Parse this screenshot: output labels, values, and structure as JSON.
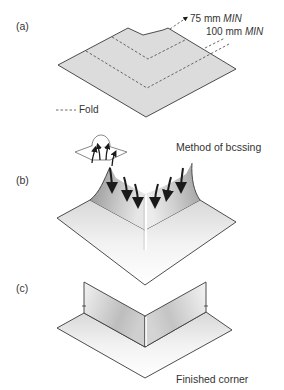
{
  "figure": {
    "panels": [
      {
        "id": "a",
        "label": "(a)",
        "annotations": {
          "dim_inner": {
            "value": "75 mm",
            "suffix": "MIN"
          },
          "dim_outer": {
            "value": "100 mm",
            "suffix": "MIN"
          }
        },
        "legend": {
          "line_style": "dashed",
          "label": "Fold"
        }
      },
      {
        "id": "b",
        "label": "(b)",
        "caption": "Method of bcssing"
      },
      {
        "id": "c",
        "label": "(c)",
        "caption": "Finished corner"
      }
    ],
    "colors": {
      "sheet_fill": "#dcdcdc",
      "outline": "#3a3a3a",
      "fold_line": "#444444",
      "arrow": "#1a1a1a",
      "shade_dark": "#9a9a9a",
      "shade_light": "#f4f4f4"
    }
  }
}
